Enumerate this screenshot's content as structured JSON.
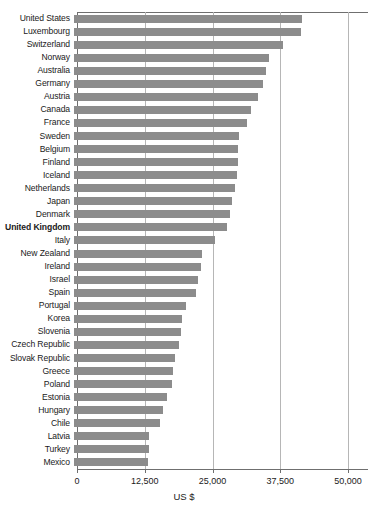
{
  "chart_data": {
    "type": "bar",
    "orientation": "horizontal",
    "title": "",
    "xlabel": "US $",
    "ylabel": "",
    "xlim": [
      0,
      50000
    ],
    "xticks": [
      0,
      12500,
      25000,
      37500,
      50000
    ],
    "xtick_labels": [
      "0",
      "12,500",
      "25,000",
      "37,500",
      "50,000"
    ],
    "grid": "vertical",
    "legend": "none",
    "bar_color": "#8c8c8c",
    "highlight_category": "United Kingdom",
    "categories": [
      "United States",
      "Luxembourg",
      "Switzerland",
      "Norway",
      "Australia",
      "Germany",
      "Austria",
      "Canada",
      "France",
      "Sweden",
      "Belgium",
      "Finland",
      "Iceland",
      "Netherlands",
      "Japan",
      "Denmark",
      "United Kingdom",
      "Italy",
      "New Zealand",
      "Ireland",
      "Israel",
      "Spain",
      "Portugal",
      "Korea",
      "Slovenia",
      "Czech Republic",
      "Slovak Republic",
      "Greece",
      "Poland",
      "Estonia",
      "Hungary",
      "Chile",
      "Latvia",
      "Turkey",
      "Mexico"
    ],
    "values": [
      42100,
      41900,
      38600,
      35900,
      35400,
      34800,
      33900,
      32600,
      31900,
      30400,
      30300,
      30200,
      30000,
      29700,
      29200,
      28700,
      28300,
      26000,
      23700,
      23400,
      22800,
      22500,
      20600,
      20000,
      19800,
      19400,
      18700,
      18200,
      18000,
      17200,
      16500,
      15900,
      13900,
      13800,
      13700
    ]
  },
  "axis": {
    "x_title": "US $"
  }
}
